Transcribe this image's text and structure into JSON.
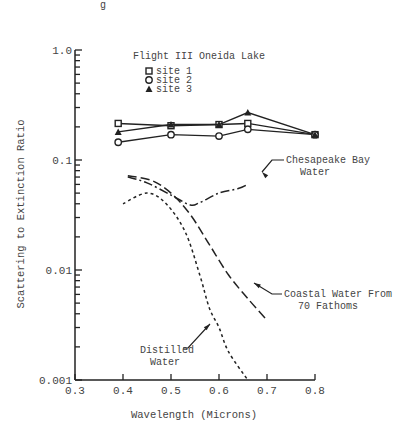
{
  "chart_data": {
    "type": "line",
    "title": "Flight III Oneida Lake",
    "caption_fragment": "g",
    "xlabel": "Wavelength (Microns)",
    "ylabel": "Scattering to Extinction Ratio",
    "xlim": [
      0.3,
      0.8
    ],
    "ylim": [
      0.001,
      1.0
    ],
    "yscale": "log",
    "grid": false,
    "legend_position": "top-left",
    "x_ticks": [
      "0.3",
      "0.4",
      "0.5",
      "0.6",
      "0.7",
      "0.8"
    ],
    "y_ticks": [
      "1.0",
      "0.1",
      "0.01",
      "0.001"
    ],
    "series": [
      {
        "name": "site 1",
        "marker": "square",
        "style": "solid",
        "x": [
          0.39,
          0.5,
          0.6,
          0.66,
          0.8
        ],
        "y": [
          0.215,
          0.205,
          0.21,
          0.215,
          0.17
        ]
      },
      {
        "name": "site 2",
        "marker": "circle",
        "style": "solid",
        "x": [
          0.39,
          0.5,
          0.6,
          0.66,
          0.8
        ],
        "y": [
          0.145,
          0.17,
          0.165,
          0.19,
          0.17
        ]
      },
      {
        "name": "site 3",
        "marker": "triangle",
        "style": "solid",
        "x": [
          0.39,
          0.5,
          0.6,
          0.66,
          0.8
        ],
        "y": [
          0.18,
          0.21,
          0.21,
          0.27,
          0.17
        ]
      },
      {
        "name": "Chesapeake Bay Water",
        "marker": "none",
        "style": "dash-dot",
        "x": [
          0.41,
          0.45,
          0.5,
          0.54,
          0.56,
          0.6,
          0.64,
          0.66
        ],
        "y": [
          0.07,
          0.062,
          0.048,
          0.039,
          0.041,
          0.05,
          0.055,
          0.06
        ]
      },
      {
        "name": "Coastal Water From 70 Fathoms",
        "marker": "none",
        "style": "long-dash",
        "x": [
          0.41,
          0.46,
          0.5,
          0.54,
          0.58,
          0.62,
          0.66,
          0.7
        ],
        "y": [
          0.072,
          0.065,
          0.05,
          0.032,
          0.017,
          0.009,
          0.0055,
          0.0035
        ]
      },
      {
        "name": "Distilled Water",
        "marker": "none",
        "style": "short-dash",
        "x": [
          0.4,
          0.45,
          0.49,
          0.53,
          0.56,
          0.58,
          0.6,
          0.62,
          0.66
        ],
        "y": [
          0.04,
          0.05,
          0.04,
          0.022,
          0.009,
          0.0045,
          0.003,
          0.0018,
          0.001
        ]
      }
    ],
    "annotations": [
      {
        "text": [
          "Chesapeake Bay",
          "Water"
        ],
        "points_to": "Chesapeake Bay Water"
      },
      {
        "text": [
          "Coastal Water From",
          "70 Fathoms"
        ],
        "points_to": "Coastal Water From 70 Fathoms"
      },
      {
        "text": [
          "Distilled",
          "Water"
        ],
        "points_to": "Distilled Water"
      }
    ]
  }
}
